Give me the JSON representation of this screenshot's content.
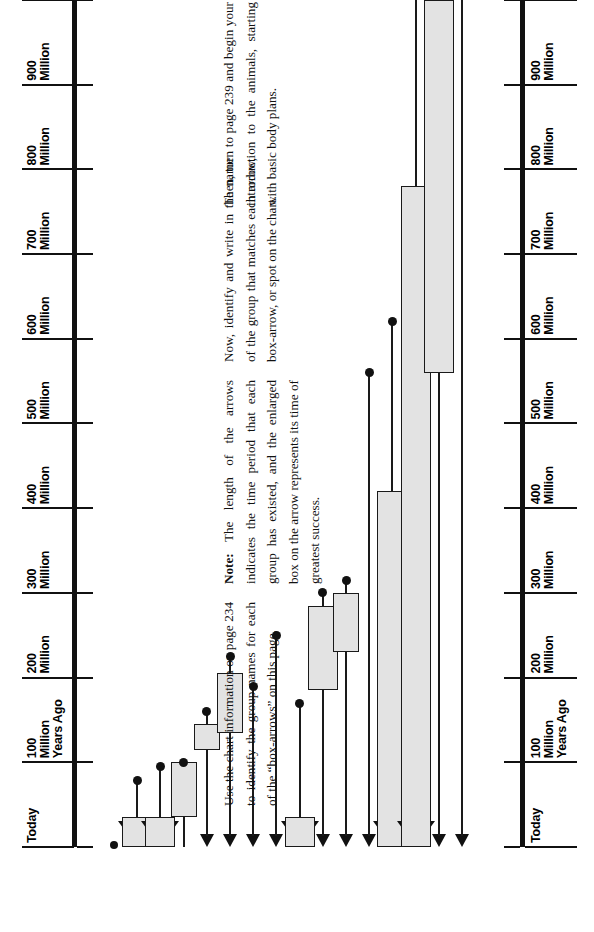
{
  "page": {
    "orientation": "rotated-90-ccw",
    "background": "#ffffff"
  },
  "axis": {
    "name": "geologic-timeline-axis",
    "start_label": "Today",
    "end_label": "1\nBillion\nYears Ago",
    "labels": [
      "Today",
      "100\nMillion\nYears Ago",
      "200\nMillion",
      "300\nMillion",
      "400\nMillion",
      "500\nMillion",
      "600\nMillion",
      "700\nMillion",
      "800\nMillion",
      "900\nMillion",
      "1\nBillion\nYears Ago"
    ],
    "tick_values": [
      0,
      100,
      200,
      300,
      400,
      500,
      600,
      700,
      800,
      900,
      1000
    ],
    "units": "Million Years Ago"
  },
  "chart_data": {
    "type": "bar",
    "title": "",
    "xlabel": "Millions of Years Ago",
    "ylabel": "",
    "xlim": [
      0,
      1000
    ],
    "grid": false,
    "legend": "none",
    "note": "Each row is an arrow whose length is the time range a group has existed; the enlarged box marks its time of greatest success.",
    "categories": [
      "row-1",
      "row-2",
      "row-3",
      "row-4",
      "row-5",
      "row-6",
      "row-7",
      "row-8",
      "row-9",
      "row-10",
      "row-11",
      "row-12",
      "row-13",
      "row-14",
      "row-15",
      "row-16",
      "row-17"
    ],
    "series": [
      {
        "name": "arrow_extent_mya",
        "values": [
          2,
          78,
          95,
          100,
          160,
          225,
          190,
          250,
          170,
          300,
          315,
          560,
          620,
          1000,
          1000,
          1000,
          1000
        ]
      },
      {
        "name": "box_start_mya",
        "values": [
          null,
          0,
          0,
          35,
          115,
          null,
          null,
          null,
          0,
          185,
          230,
          null,
          null,
          0,
          0,
          560,
          null
        ]
      },
      {
        "name": "box_end_mya",
        "values": [
          null,
          35,
          35,
          100,
          145,
          null,
          null,
          null,
          35,
          240,
          300,
          null,
          null,
          420,
          780,
          1000,
          null
        ]
      }
    ],
    "rows": [
      {
        "id": 1,
        "head": "none",
        "shaft_to": 2,
        "dot_at": 2,
        "box": null
      },
      {
        "id": 2,
        "head": "big",
        "shaft_to": 78,
        "dot_at": 78,
        "box": [
          0,
          35
        ]
      },
      {
        "id": 3,
        "head": "big",
        "shaft_to": 95,
        "dot_at": 95,
        "box": [
          0,
          35
        ]
      },
      {
        "id": 4,
        "head": "none",
        "shaft_to": 100,
        "dot_at": 100,
        "box": [
          35,
          100
        ]
      },
      {
        "id": 5,
        "head": "small",
        "shaft_to": 160,
        "dot_at": 160,
        "box": [
          115,
          145
        ]
      },
      {
        "id": 6,
        "head": "small",
        "shaft_to": 225,
        "dot_at": 225,
        "box": [
          135,
          205
        ]
      },
      {
        "id": 7,
        "head": "small",
        "shaft_to": 190,
        "dot_at": 190,
        "box": null
      },
      {
        "id": 8,
        "head": "small",
        "shaft_to": 250,
        "dot_at": 250,
        "box": null
      },
      {
        "id": 9,
        "head": "big",
        "shaft_to": 170,
        "dot_at": 170,
        "box": [
          0,
          35
        ]
      },
      {
        "id": 10,
        "head": "small",
        "shaft_to": 300,
        "dot_at": 300,
        "box": [
          185,
          285
        ]
      },
      {
        "id": 11,
        "head": "small",
        "shaft_to": 315,
        "dot_at": 315,
        "box": [
          230,
          300
        ]
      },
      {
        "id": 12,
        "head": "small",
        "shaft_to": 560,
        "dot_at": 560,
        "box": null
      },
      {
        "id": 13,
        "head": "big",
        "shaft_to": 620,
        "dot_at": 620,
        "box": [
          0,
          420
        ]
      },
      {
        "id": 14,
        "head": "big",
        "shaft_to": 1000,
        "dot_at": null,
        "box": [
          0,
          780
        ]
      },
      {
        "id": 15,
        "head": "small",
        "shaft_to": 1000,
        "dot_at": null,
        "box": [
          560,
          1000
        ]
      },
      {
        "id": 16,
        "head": "small",
        "shaft_to": 1000,
        "dot_at": null,
        "box": null
      }
    ]
  },
  "instructions": {
    "paragraph_1": "Use the chart information on page 234 to identify the group names for each of the “box-arrows” on this page.",
    "paragraph_2_lead": "Note:",
    "paragraph_2": " The length of the arrows indicates the time period that each group has existed, and the enlarged box on the arrow represents its time of greatest success.",
    "paragraph_3": "Now, identify and write in the name of the group that matches each arrow, box-arrow, or spot on the chart.",
    "paragraph_4": "Then, turn to page 239 and begin your introduction to the animals, starting with basic body plans."
  },
  "colors": {
    "ink": "#111111",
    "box_fill": "#e3e3e3",
    "box_stroke": "#1a1a1a",
    "paper": "#ffffff"
  }
}
